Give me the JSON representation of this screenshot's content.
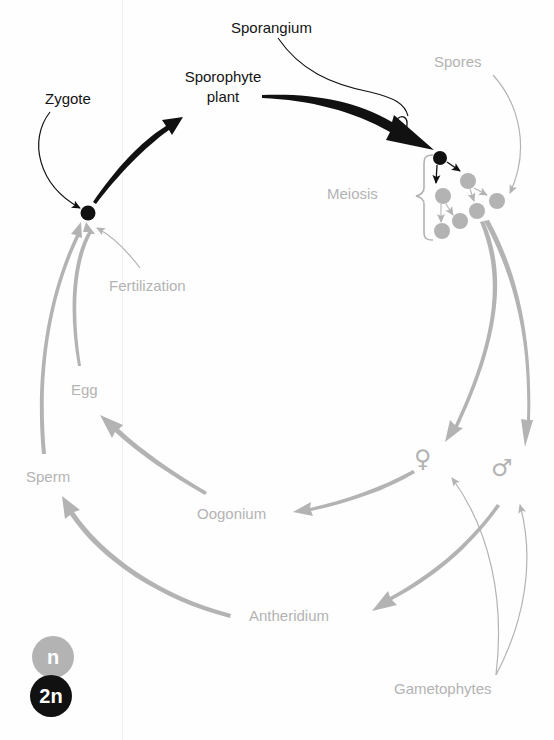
{
  "diagram": {
    "type": "life-cycle",
    "colors": {
      "diploid": "#111111",
      "haploid": "#b3b3b3",
      "background": "#fefefe"
    },
    "labels": {
      "zygote": "Zygote",
      "sporangium": "Sporangium",
      "sporophyte_line1": "Sporophyte",
      "sporophyte_line2": "plant",
      "spores": "Spores",
      "meiosis": "Meiosis",
      "fertilization": "Fertilization",
      "egg": "Egg",
      "sperm": "Sperm",
      "oogonium": "Oogonium",
      "antheridium": "Antheridium",
      "gametophytes": "Gametophytes"
    },
    "symbols": {
      "female": "♀",
      "male": "♂"
    },
    "legend": {
      "haploid_label": "n",
      "diploid_label": "2n"
    },
    "stages": [
      {
        "name": "Zygote",
        "ploidy": "2n"
      },
      {
        "name": "Sporophyte plant",
        "ploidy": "2n"
      },
      {
        "name": "Sporangium",
        "ploidy": "2n"
      },
      {
        "name": "Meiosis",
        "ploidy": "2n → n"
      },
      {
        "name": "Spores",
        "ploidy": "n"
      },
      {
        "name": "Gametophytes (♀, ♂)",
        "ploidy": "n"
      },
      {
        "name": "Oogonium",
        "ploidy": "n"
      },
      {
        "name": "Antheridium",
        "ploidy": "n"
      },
      {
        "name": "Egg",
        "ploidy": "n"
      },
      {
        "name": "Sperm",
        "ploidy": "n"
      },
      {
        "name": "Fertilization",
        "ploidy": "n → 2n"
      }
    ]
  }
}
